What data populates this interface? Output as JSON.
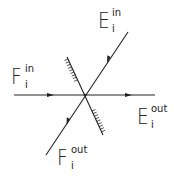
{
  "diagram": {
    "title": "",
    "colors": {
      "ink": "#222222",
      "background": "#ffffff"
    },
    "labels": {
      "e_in": {
        "base": "E",
        "sub": "i",
        "sup": "in"
      },
      "f_in": {
        "base": "F",
        "sub": "i",
        "sup": "in"
      },
      "e_out": {
        "base": "E",
        "sub": "i",
        "sup": "out"
      },
      "f_out": {
        "base": "F",
        "sub": "i",
        "sup": "out"
      }
    },
    "elements": [
      {
        "id": "horizontal-ray",
        "description": "F_i^in incoming from left, continues as E_i^out to right"
      },
      {
        "id": "diagonal-ray",
        "description": "E_i^in incoming from upper right, continues as F_i^out to lower left"
      },
      {
        "id": "mirror",
        "description": "hatched interface line through the crossing point"
      }
    ]
  }
}
